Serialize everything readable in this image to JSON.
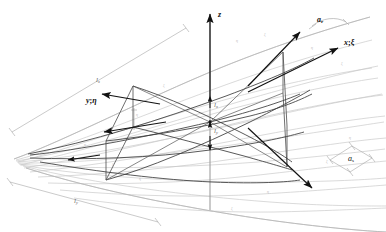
{
  "figure": {
    "type": "3d-engineering-diagram",
    "background_color": "#ffffff",
    "ink_color": "#111111",
    "mesh_color": "#c4c4c4",
    "section_color": "#4a4a4a",
    "dim_color": "#9a9a9a"
  },
  "axes": {
    "z": {
      "label": "z",
      "description": "vertical axis pointing up"
    },
    "x": {
      "label": "x",
      "separator": ";",
      "alt": "ξ",
      "description": "axis to upper right"
    },
    "y": {
      "label": "y",
      "separator": ";",
      "alt": "η",
      "description": "axis to upper left"
    }
  },
  "vectors": {
    "a_upper": {
      "base": "a",
      "sub": "r",
      "description": "vector arrow toward upper right with curved arc"
    },
    "a_x": {
      "base": "x",
      "sep": ";",
      "alt": "ξ",
      "description": "axis vector to the right"
    },
    "down_right": {
      "description": "unlabeled arrow pointing down-right"
    },
    "left_upper": {
      "description": "unlabeled arrow pointing left"
    },
    "left_lower": {
      "description": "unlabeled arrow pointing left-down"
    },
    "left_tip": {
      "description": "unlabeled arrow pointing left at surface tip"
    }
  },
  "dimensions": {
    "lx_center": {
      "base": "l",
      "sub": "x",
      "description": "vertical dimension above origin"
    },
    "ly_center": {
      "base": "l",
      "sub": "y",
      "description": "vertical dimension below origin"
    },
    "lx_left": {
      "base": "l",
      "sub": "x",
      "description": "dimension line along upper-left edge"
    },
    "ly_bottom": {
      "base": "l",
      "sub": "y",
      "description": "dimension line along lower-left edge"
    },
    "as_right": {
      "base": "a",
      "sub": "s",
      "description": "dimension on right edge of surface"
    }
  },
  "mesh": {
    "u_lines": 9,
    "v_lines": 8,
    "style": "light gray curvilinear grid",
    "tick_labels": [
      "ξ",
      "η",
      "ξ",
      "η",
      "ξ",
      "η",
      "ξ",
      "η",
      "ξ",
      "η",
      "ξ",
      "η"
    ]
  },
  "sections": {
    "left_plane": {
      "label": "η",
      "description": "left vertical quadrilateral cutting plane"
    },
    "right_plane": {
      "description": "right vertical quadrilateral cutting plane"
    }
  }
}
